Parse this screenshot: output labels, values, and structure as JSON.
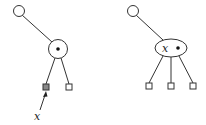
{
  "diagrams": [
    {
      "id": "before",
      "root": {
        "shape": "circle"
      },
      "internal_node": {
        "shape": "circle",
        "marker": "dot"
      },
      "leaves": [
        {
          "shape": "square",
          "highlighted": true
        },
        {
          "shape": "square",
          "highlighted": false
        }
      ],
      "pointer": {
        "label": "x",
        "target": "highlighted-leaf"
      }
    },
    {
      "id": "after",
      "root": {
        "shape": "circle"
      },
      "internal_node": {
        "shape": "ellipse",
        "label": "x",
        "marker": "dot"
      },
      "leaves": [
        {
          "shape": "square",
          "highlighted": false
        },
        {
          "shape": "square",
          "highlighted": false
        },
        {
          "shape": "square",
          "highlighted": false
        }
      ]
    }
  ],
  "labels": {
    "left_pointer": "x",
    "right_node_key": "x"
  },
  "colors": {
    "stroke": "#333333",
    "highlight_fill": "#888888",
    "background": "#ffffff"
  }
}
